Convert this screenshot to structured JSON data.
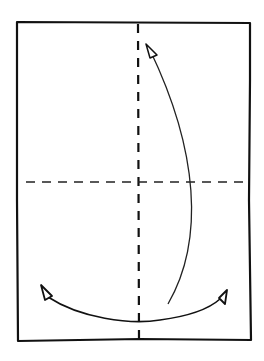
{
  "diagram": {
    "type": "origami-fold-diagram",
    "paper": {
      "x": 16,
      "y": 21,
      "width": 235,
      "height": 320,
      "stroke": "#111111"
    },
    "vertical_crease": {
      "x": 137,
      "y1": 22,
      "y2": 338,
      "style": "valley-dashed"
    },
    "horizontal_crease": {
      "y": 181,
      "x1": 26,
      "x2": 250,
      "style": "valley-dashed"
    },
    "arrows": [
      {
        "name": "fold-up-arrow",
        "description": "curved arrow from bottom right up to top center"
      },
      {
        "name": "fold-sideways-arrow",
        "description": "double-headed curved arrow between bottom left and bottom right"
      }
    ]
  }
}
